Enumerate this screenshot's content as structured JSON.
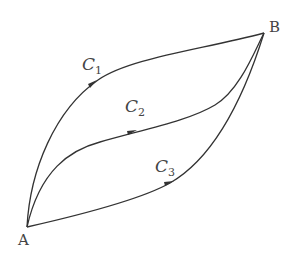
{
  "diagram": {
    "points": {
      "A": {
        "label": "A",
        "x": 27,
        "y": 227
      },
      "B": {
        "label": "B",
        "x": 264,
        "y": 33
      }
    },
    "curves": [
      {
        "name": "C",
        "subscript": "1",
        "from": "A",
        "to": "B",
        "direction": "A to B"
      },
      {
        "name": "C",
        "subscript": "2",
        "from": "A",
        "to": "B",
        "direction": "A to B"
      },
      {
        "name": "C",
        "subscript": "3",
        "from": "A",
        "to": "B",
        "direction": "A to B"
      }
    ],
    "colors": {
      "stroke": "#333333",
      "text": "#444444",
      "background": "#ffffff"
    }
  }
}
